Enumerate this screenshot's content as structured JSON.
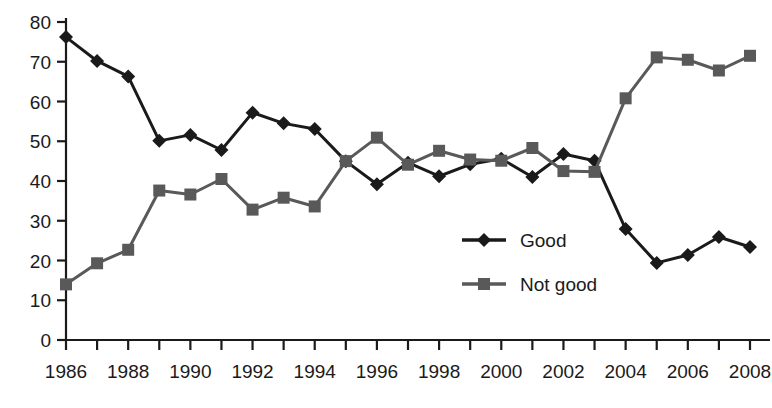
{
  "chart_data": {
    "type": "line",
    "title": "",
    "subtitle": "",
    "xlabel": "",
    "ylabel": "",
    "xlim": [
      1986,
      2008
    ],
    "ylim": [
      0,
      80
    ],
    "ytick_step": 10,
    "yticks": [
      0,
      10,
      20,
      30,
      40,
      50,
      60,
      70,
      80
    ],
    "xticks_major": [
      1986,
      1988,
      1990,
      1992,
      1994,
      1996,
      1998,
      2000,
      2002,
      2004,
      2006,
      2008
    ],
    "xticks_minor": [
      1987,
      1989,
      1991,
      1993,
      1995,
      1997,
      1999,
      2001,
      2003,
      2005,
      2007
    ],
    "grid": false,
    "legend_position": "center",
    "x": [
      1986,
      1987,
      1988,
      1989,
      1990,
      1991,
      1992,
      1993,
      1994,
      1995,
      1996,
      1997,
      1998,
      1999,
      2000,
      2001,
      2002,
      2003,
      2004,
      2005,
      2006,
      2007,
      2008
    ],
    "series": [
      {
        "name": "Good",
        "color": "#1a1a1a",
        "marker": "diamond",
        "values": [
          76.2,
          70.2,
          66.3,
          50.1,
          51.6,
          47.8,
          57.2,
          54.5,
          53.1,
          45.0,
          39.2,
          44.6,
          41.2,
          44.2,
          45.6,
          41.0,
          46.8,
          45.1,
          27.9,
          19.4,
          21.4,
          25.9,
          23.4
        ]
      },
      {
        "name": "Not good",
        "color": "#595959",
        "marker": "square",
        "values": [
          14.0,
          19.3,
          22.7,
          37.6,
          36.6,
          40.5,
          32.8,
          35.8,
          33.6,
          45.0,
          50.9,
          44.1,
          47.6,
          45.4,
          45.1,
          48.3,
          42.5,
          42.3,
          60.8,
          71.1,
          70.5,
          67.8,
          71.5
        ]
      }
    ],
    "legend": [
      {
        "label": "Good",
        "color": "#1a1a1a",
        "marker": "diamond"
      },
      {
        "label": "Not good",
        "color": "#595959",
        "marker": "square"
      }
    ]
  },
  "axis": {
    "ytick_labels": [
      "0",
      "10",
      "20",
      "30",
      "40",
      "50",
      "60",
      "70",
      "80"
    ],
    "xtick_labels": [
      "1986",
      "1988",
      "1990",
      "1992",
      "1994",
      "1996",
      "1998",
      "2000",
      "2002",
      "2004",
      "2006",
      "2008"
    ]
  },
  "legend": {
    "items": [
      {
        "label": "Good"
      },
      {
        "label": "Not good"
      }
    ]
  },
  "caption": {
    "partial_text": ""
  }
}
